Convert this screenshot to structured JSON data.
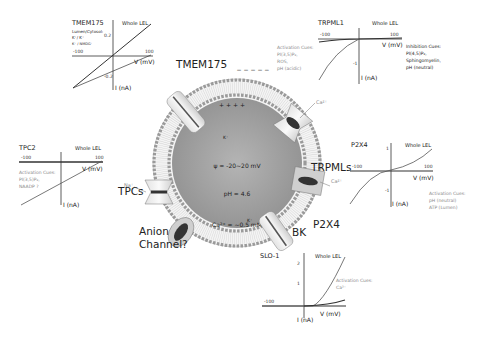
{
  "lysosome": {
    "membrane_potential": "ψ = -20~20 mV",
    "ph": "pH = 4.6",
    "calcium": "Ca²⁺ = ~0.5 mM",
    "surface_charge": "+ + + +",
    "outer_charge": "− − − − −"
  },
  "channels": {
    "tmem175": "TMEM175",
    "trpmls": "TRPMLs",
    "tpcs": "TPCs",
    "p2x4": "P2X4",
    "bk": "BK",
    "anion_line1": "Anion",
    "anion_line2": "Channel?"
  },
  "ions": {
    "k_tmem": "K⁺",
    "ca_trpml": "Ca²⁺",
    "na_tpc": "Na⁺",
    "ca_p2x4": "Ca²⁺",
    "k_bk": "K⁺"
  },
  "plots": {
    "tmem175": {
      "title": "TMEM175",
      "whole": "Whole LEL",
      "note1": "Lumen/Cytosol:",
      "note2": "K⁺/ K⁺",
      "note3": "K⁺ / NMDG⁺",
      "xneg": "-100",
      "xpos": "100",
      "ypos": "0.2",
      "yneg": "-0.2",
      "xlabel": "V (mV)",
      "ylabel": "I (nA)"
    },
    "trpml1": {
      "title": "TRPML1",
      "whole": "Whole LEL",
      "xneg": "-100",
      "xpos": "100",
      "yneg": "-1",
      "xlabel": "V (mV)",
      "ylabel": "I (nA)",
      "activation": [
        "Activation Cues:",
        "PI(3,5)P₂,",
        "ROS,",
        "pH (acidic)"
      ],
      "inhibition": [
        "Inhibition Cues:",
        "PI(4,5)P₂,",
        "Sphingomyelin,",
        "pH (neutral)"
      ]
    },
    "tpc2": {
      "title": "TPC2",
      "whole": "Whole LEL",
      "xneg": "-100",
      "xpos": "100",
      "xlabel": "V (mV)",
      "ylabel": "I (nA)",
      "activation": [
        "Activation Cues:",
        "PI(3,5)P₂,",
        "NAADP ?"
      ]
    },
    "p2x4": {
      "title": "P2X4",
      "whole": "Whole LEL",
      "xneg": "-100",
      "xpos": "100",
      "ypos": "1",
      "yneg": "-1",
      "xlabel": "V (mV)",
      "ylabel": "I (nA)",
      "activation": [
        "Activation Cues:",
        "pH (neutral)",
        "ATP (Lumen)"
      ]
    },
    "slo1": {
      "title": "SLO-1",
      "whole": "Whole LEL",
      "xneg": "-100",
      "y2": "2",
      "y1": "1",
      "xlabel": "V (mV)",
      "ylabel": "I (nA)",
      "activation": [
        "Activation Cues:",
        "Ca²⁺"
      ]
    }
  }
}
